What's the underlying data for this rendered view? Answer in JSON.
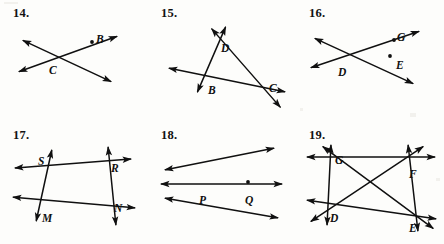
{
  "page": {
    "background_color": "#fdfdfb",
    "ink_color": "#101010",
    "width": 444,
    "height": 244
  },
  "problems": [
    {
      "number": "14.",
      "name": "problem-14",
      "origin": [
        0,
        0
      ],
      "description": "Two lines crossing at point C; point B marked on the upper-right ray.",
      "points": [
        {
          "label": "B",
          "x": 96,
          "y": 33,
          "dot": true,
          "dot_x": 92,
          "dot_y": 42,
          "label_dx": 0,
          "label_dy": 0
        },
        {
          "label": "C",
          "x": 49,
          "y": 64,
          "dot": false,
          "dot_x": 0,
          "dot_y": 0,
          "label_dx": 0,
          "label_dy": 0
        }
      ],
      "segments": [
        {
          "name": "line-through-C-up-right",
          "x1": 18,
          "y1": 72,
          "x2": 118,
          "y2": 36,
          "arrow_start": true,
          "arrow_end": true
        },
        {
          "name": "line-through-C-down-right",
          "x1": 22,
          "y1": 40,
          "x2": 112,
          "y2": 82,
          "arrow_start": true,
          "arrow_end": true
        }
      ]
    },
    {
      "number": "15.",
      "name": "problem-15",
      "origin": [
        148,
        0
      ],
      "description": "Triangle B-D-C with each side extended into a full line past both vertices.",
      "points": [
        {
          "label": "D",
          "x": 73,
          "y": 42,
          "dot": false,
          "dot_x": 0,
          "dot_y": 0,
          "label_dx": 0,
          "label_dy": 0
        },
        {
          "label": "B",
          "x": 60,
          "y": 84,
          "dot": false,
          "dot_x": 0,
          "dot_y": 0,
          "label_dx": 0,
          "label_dy": 0
        },
        {
          "label": "C",
          "x": 121,
          "y": 82,
          "dot": false,
          "dot_x": 0,
          "dot_y": 0,
          "label_dx": 0,
          "label_dy": 0
        }
      ],
      "segments": [
        {
          "name": "line-B-D-extended",
          "x1": 49,
          "y1": 93,
          "x2": 78,
          "y2": 26,
          "arrow_start": true,
          "arrow_end": true
        },
        {
          "name": "line-D-C-extended",
          "x1": 63,
          "y1": 28,
          "x2": 133,
          "y2": 108,
          "arrow_start": true,
          "arrow_end": true
        },
        {
          "name": "line-B-C-extended",
          "x1": 20,
          "y1": 68,
          "x2": 138,
          "y2": 92,
          "arrow_start": true,
          "arrow_end": true
        }
      ]
    },
    {
      "number": "16.",
      "name": "problem-16",
      "origin": [
        296,
        0
      ],
      "description": "Two lines crossing at D; point G on the upper-right ray; isolated point E at right.",
      "points": [
        {
          "label": "G",
          "x": 101,
          "y": 31,
          "dot": true,
          "dot_x": 98,
          "dot_y": 40,
          "label_dx": 0,
          "label_dy": 0
        },
        {
          "label": "D",
          "x": 42,
          "y": 66,
          "dot": false,
          "dot_x": 0,
          "dot_y": 0,
          "label_dx": 0,
          "label_dy": 0
        },
        {
          "label": "E",
          "x": 100,
          "y": 59,
          "dot": true,
          "dot_x": 94,
          "dot_y": 56,
          "label_dx": 0,
          "label_dy": 0
        }
      ],
      "segments": [
        {
          "name": "line-through-D-up-right",
          "x1": 14,
          "y1": 68,
          "x2": 124,
          "y2": 31,
          "arrow_start": true,
          "arrow_end": true
        },
        {
          "name": "line-through-D-down-right",
          "x1": 18,
          "y1": 38,
          "x2": 118,
          "y2": 84,
          "arrow_start": true,
          "arrow_end": true
        }
      ]
    },
    {
      "number": "17.",
      "name": "problem-17",
      "origin": [
        0,
        122
      ],
      "description": "Quadrilateral S-R-N-M; each side drawn as a line extending past both vertices.",
      "points": [
        {
          "label": "S",
          "x": 38,
          "y": 33,
          "dot": false,
          "dot_x": 0,
          "dot_y": 0,
          "label_dx": 0,
          "label_dy": 0
        },
        {
          "label": "R",
          "x": 111,
          "y": 40,
          "dot": false,
          "dot_x": 0,
          "dot_y": 0,
          "label_dx": 0,
          "label_dy": 0
        },
        {
          "label": "N",
          "x": 114,
          "y": 80,
          "dot": false,
          "dot_x": 0,
          "dot_y": 0,
          "label_dx": 0,
          "label_dy": 0
        },
        {
          "label": "M",
          "x": 42,
          "y": 90,
          "dot": false,
          "dot_x": 0,
          "dot_y": 0,
          "label_dx": 0,
          "label_dy": 0
        }
      ],
      "segments": [
        {
          "name": "line-S-R-extended",
          "x1": 14,
          "y1": 46,
          "x2": 132,
          "y2": 37,
          "arrow_start": true,
          "arrow_end": true
        },
        {
          "name": "line-M-N-extended",
          "x1": 12,
          "y1": 75,
          "x2": 136,
          "y2": 86,
          "arrow_start": true,
          "arrow_end": true
        },
        {
          "name": "line-S-M-extended",
          "x1": 52,
          "y1": 27,
          "x2": 36,
          "y2": 100,
          "arrow_start": true,
          "arrow_end": true
        },
        {
          "name": "line-R-N-extended",
          "x1": 108,
          "y1": 24,
          "x2": 116,
          "y2": 104,
          "arrow_start": true,
          "arrow_end": true
        }
      ]
    },
    {
      "number": "18.",
      "name": "problem-18",
      "origin": [
        148,
        122
      ],
      "description": "Three lines concurrent at P: a horizontal line, a line rising to the right, and a line falling to the right. Point Q lies on the horizontal line right of P.",
      "points": [
        {
          "label": "P",
          "x": 51,
          "y": 72,
          "dot": false,
          "dot_x": 0,
          "dot_y": 0,
          "label_dx": 0,
          "label_dy": 0
        },
        {
          "label": "Q",
          "x": 97,
          "y": 72,
          "dot": true,
          "dot_x": 100,
          "dot_y": 60,
          "label_dx": 0,
          "label_dy": 0
        }
      ],
      "segments": [
        {
          "name": "line-horizontal-through-P",
          "x1": 12,
          "y1": 62,
          "x2": 135,
          "y2": 62,
          "arrow_start": true,
          "arrow_end": true
        },
        {
          "name": "line-rising-through-P",
          "x1": 16,
          "y1": 48,
          "x2": 127,
          "y2": 26,
          "arrow_start": true,
          "arrow_end": true
        },
        {
          "name": "line-falling-through-P",
          "x1": 16,
          "y1": 76,
          "x2": 131,
          "y2": 96,
          "arrow_start": true,
          "arrow_end": true
        }
      ]
    },
    {
      "number": "19.",
      "name": "problem-19",
      "origin": [
        296,
        122
      ],
      "description": "Quadrilateral G-F-E-D with both diagonals; all six lines extended past their endpoints.",
      "points": [
        {
          "label": "G",
          "x": 39,
          "y": 32,
          "dot": false,
          "dot_x": 0,
          "dot_y": 0,
          "label_dx": 0,
          "label_dy": 0
        },
        {
          "label": "F",
          "x": 113,
          "y": 46,
          "dot": false,
          "dot_x": 0,
          "dot_y": 0,
          "label_dx": 0,
          "label_dy": 0
        },
        {
          "label": "D",
          "x": 34,
          "y": 90,
          "dot": false,
          "dot_x": 0,
          "dot_y": 0,
          "label_dx": 0,
          "label_dy": 0
        },
        {
          "label": "E",
          "x": 113,
          "y": 100,
          "dot": false,
          "dot_x": 0,
          "dot_y": 0,
          "label_dx": 0,
          "label_dy": 0
        }
      ],
      "segments": [
        {
          "name": "line-G-F-extended",
          "x1": 10,
          "y1": 35,
          "x2": 140,
          "y2": 35,
          "arrow_start": true,
          "arrow_end": true
        },
        {
          "name": "line-G-D-extended",
          "x1": 35,
          "y1": 22,
          "x2": 31,
          "y2": 104,
          "arrow_start": true,
          "arrow_end": true
        },
        {
          "name": "line-F-E-extended",
          "x1": 112,
          "y1": 22,
          "x2": 122,
          "y2": 110,
          "arrow_start": true,
          "arrow_end": true
        },
        {
          "name": "line-D-E-extended",
          "x1": 10,
          "y1": 78,
          "x2": 141,
          "y2": 97,
          "arrow_start": true,
          "arrow_end": true
        },
        {
          "name": "diagonal-G-E-extended",
          "x1": 26,
          "y1": 24,
          "x2": 138,
          "y2": 107,
          "arrow_start": true,
          "arrow_end": true
        },
        {
          "name": "diagonal-D-F-extended",
          "x1": 14,
          "y1": 100,
          "x2": 128,
          "y2": 24,
          "arrow_start": true,
          "arrow_end": true
        }
      ]
    }
  ]
}
